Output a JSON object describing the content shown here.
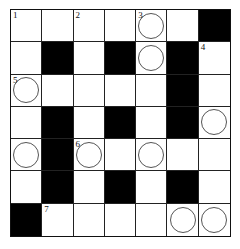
{
  "puzzle": {
    "type": "crossword",
    "rows": 7,
    "cols": 7,
    "colors": {
      "black": "#000000",
      "white": "#ffffff",
      "line": "#222222",
      "circle": "#555555"
    },
    "cells": [
      [
        {
          "t": "w",
          "n": "1"
        },
        {
          "t": "w"
        },
        {
          "t": "w",
          "n": "2"
        },
        {
          "t": "w"
        },
        {
          "t": "w",
          "n": "3",
          "c": true
        },
        {
          "t": "w"
        },
        {
          "t": "b"
        }
      ],
      [
        {
          "t": "w"
        },
        {
          "t": "b"
        },
        {
          "t": "w"
        },
        {
          "t": "b"
        },
        {
          "t": "w",
          "c": true
        },
        {
          "t": "b"
        },
        {
          "t": "w",
          "n": "4"
        }
      ],
      [
        {
          "t": "w",
          "n": "5",
          "c": true
        },
        {
          "t": "w"
        },
        {
          "t": "w"
        },
        {
          "t": "w"
        },
        {
          "t": "w"
        },
        {
          "t": "b"
        },
        {
          "t": "w"
        }
      ],
      [
        {
          "t": "w"
        },
        {
          "t": "b"
        },
        {
          "t": "w"
        },
        {
          "t": "b"
        },
        {
          "t": "w"
        },
        {
          "t": "b"
        },
        {
          "t": "w",
          "c": true
        }
      ],
      [
        {
          "t": "w",
          "c": true
        },
        {
          "t": "b"
        },
        {
          "t": "w",
          "n": "6",
          "c": true
        },
        {
          "t": "w"
        },
        {
          "t": "w",
          "c": true
        },
        {
          "t": "w"
        },
        {
          "t": "w"
        }
      ],
      [
        {
          "t": "w"
        },
        {
          "t": "b"
        },
        {
          "t": "w"
        },
        {
          "t": "b"
        },
        {
          "t": "w"
        },
        {
          "t": "b"
        },
        {
          "t": "w"
        }
      ],
      [
        {
          "t": "b"
        },
        {
          "t": "w",
          "n": "7"
        },
        {
          "t": "w"
        },
        {
          "t": "w"
        },
        {
          "t": "w"
        },
        {
          "t": "w",
          "c": true
        },
        {
          "t": "w",
          "c": true
        }
      ]
    ]
  }
}
